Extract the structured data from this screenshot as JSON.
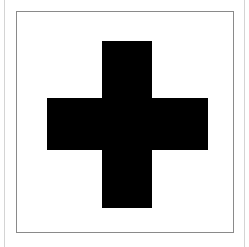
{
  "symbol": {
    "name": "cross",
    "fill_color": "#000000",
    "background_color": "#ffffff",
    "frame_color": "#8a8a8a"
  }
}
